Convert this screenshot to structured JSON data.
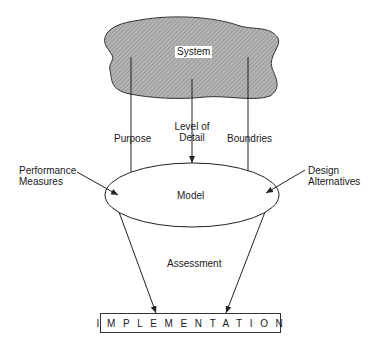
{
  "diagram": {
    "nodes": {
      "system": "System",
      "model": "Model",
      "implementation": "IMPLEMENTATION"
    },
    "edge_labels": {
      "purpose": "Purpose",
      "level_of_detail_line1": "Level of",
      "level_of_detail_line2": "Detail",
      "boundries": "Boundries",
      "assessment": "Assessment"
    },
    "inputs": {
      "performance_line1": "Performance",
      "performance_line2": "Measures",
      "design_line1": "Design",
      "design_line2": "Alternatives"
    },
    "colors": {
      "cloud_fill": "#a9a9a9",
      "stroke": "#222222"
    }
  }
}
